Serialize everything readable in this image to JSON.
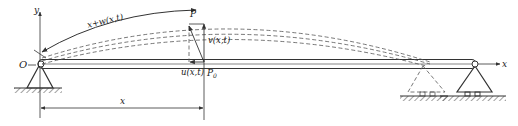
{
  "figure": {
    "type": "beam-deflection-schematic",
    "labels": {
      "origin": "O",
      "y_axis": "y",
      "x_axis": "x",
      "arc_length": "x+w(x,t)",
      "point_deformed": "P",
      "point_original": "P",
      "point_original_sub": "0",
      "transverse_disp": "v(x,t)",
      "axial_disp": "u(x,t)",
      "x_dimension": "x"
    },
    "colors": {
      "line": "#333333",
      "dashed": "#555555",
      "background": "#ffffff"
    }
  }
}
